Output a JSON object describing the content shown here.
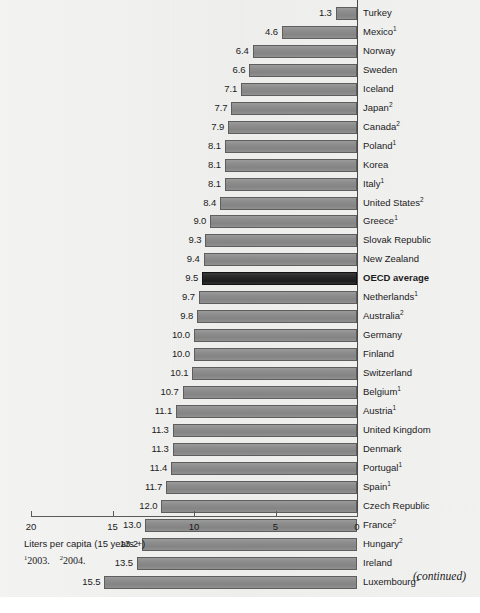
{
  "chart_data": {
    "type": "bar",
    "orientation": "horizontal-right-to-left",
    "title": "",
    "xlabel": "Liters per capita (15 years +)",
    "ylabel": "",
    "xlim": [
      20,
      0
    ],
    "xticks": [
      20,
      15,
      10,
      5,
      0
    ],
    "grid": false,
    "legend": "none",
    "unit": "Liters per capita (15 years +)",
    "highlight_category": "OECD average",
    "categories": [
      "Turkey",
      "Mexico",
      "Norway",
      "Sweden",
      "Iceland",
      "Japan",
      "Canada",
      "Poland",
      "Korea",
      "Italy",
      "United States",
      "Greece",
      "Slovak Republic",
      "New Zealand",
      "OECD average",
      "Netherlands",
      "Australia",
      "Germany",
      "Finland",
      "Switzerland",
      "Belgium",
      "Austria",
      "United Kingdom",
      "Denmark",
      "Portugal",
      "Spain",
      "Czech Republic",
      "France",
      "Hungary",
      "Ireland",
      "Luxembourg"
    ],
    "values": [
      1.3,
      4.6,
      6.4,
      6.6,
      7.1,
      7.7,
      7.9,
      8.1,
      8.1,
      8.1,
      8.4,
      9.0,
      9.3,
      9.4,
      9.5,
      9.7,
      9.8,
      10.0,
      10.0,
      10.1,
      10.7,
      11.1,
      11.3,
      11.3,
      11.4,
      11.7,
      12.0,
      13.0,
      13.2,
      13.5,
      15.5
    ],
    "footnote_markers": [
      "",
      "1",
      "",
      "",
      "",
      "2",
      "2",
      "1",
      "",
      "1",
      "2",
      "1",
      "",
      "",
      "",
      "1",
      "2",
      "",
      "",
      "",
      "1",
      "1",
      "",
      "",
      "1",
      "1",
      "",
      "2",
      "2",
      "",
      "1"
    ],
    "value_labels": [
      "1.3",
      "4.6",
      "6.4",
      "6.6",
      "7.1",
      "7.7",
      "7.9",
      "8.1",
      "8.1",
      "8.1",
      "8.4",
      "9.0",
      "9.3",
      "9.4",
      "9.5",
      "9.7",
      "9.8",
      "10.0",
      "10.0",
      "10.1",
      "10.7",
      "11.1",
      "11.3",
      "11.3",
      "11.4",
      "11.7",
      "12.0",
      "13.0",
      "13.2",
      "13.5",
      "15.5"
    ],
    "colors": {
      "bar_fill": "#8c8c8c",
      "bar_border": "#5e5e5e",
      "highlight_fill": "#262626",
      "highlight_border": "#121212",
      "axis": "#5a5a5a",
      "text": "#1b1b1b",
      "background": "#efefee"
    }
  },
  "axis": {
    "tick_labels": [
      "20",
      "15",
      "10",
      "5",
      "0"
    ],
    "caption": "Liters per capita (15 years +)"
  },
  "footnotes": {
    "marker_1": "1",
    "text_1": "2003.",
    "marker_2": "2",
    "text_2": "2004."
  },
  "page": {
    "continued_label": "(continued)"
  }
}
